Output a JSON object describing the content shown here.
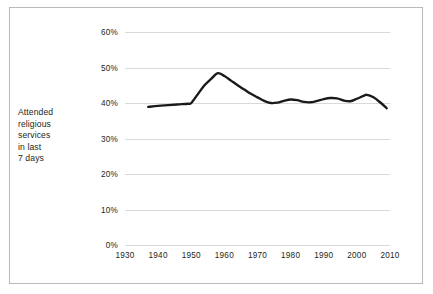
{
  "figure": {
    "y_axis_caption_lines": [
      "Attended",
      "religious",
      "services",
      "in last",
      "7 days"
    ],
    "line_color": "#1a1a1a",
    "grid_color": "#d9d9d9",
    "frame_color": "#b9b9b9",
    "background": "#ffffff"
  },
  "chart_data": {
    "type": "line",
    "title": "",
    "subtitle": "",
    "xlabel": "",
    "ylabel": "Attended religious services in last 7 days",
    "xlim": [
      1930,
      2010
    ],
    "ylim": [
      0,
      60
    ],
    "y_tick_labels": [
      "0%",
      "10%",
      "20%",
      "30%",
      "40%",
      "50%",
      "60%"
    ],
    "y_tick_values": [
      0,
      10,
      20,
      30,
      40,
      50,
      60
    ],
    "x_tick_labels": [
      "1930",
      "1940",
      "1950",
      "1960",
      "1970",
      "1980",
      "1990",
      "2000",
      "2010"
    ],
    "x_tick_values": [
      1930,
      1940,
      1950,
      1960,
      1970,
      1980,
      1990,
      2000,
      2010
    ],
    "grid": "horizontal",
    "legend": "none",
    "series": [
      {
        "name": "Attended religious services in last 7 days",
        "color": "#1a1a1a",
        "x": [
          1937,
          1940,
          1943,
          1946,
          1949,
          1950,
          1952,
          1954,
          1956,
          1958,
          1960,
          1962,
          1964,
          1966,
          1968,
          1970,
          1972,
          1974,
          1976,
          1978,
          1980,
          1982,
          1984,
          1986,
          1988,
          1990,
          1992,
          1994,
          1996,
          1998,
          2000,
          2002,
          2003,
          2005,
          2007,
          2009
        ],
        "values": [
          38.9,
          39.2,
          39.4,
          39.6,
          39.8,
          40.0,
          42.5,
          45.0,
          46.8,
          48.4,
          47.6,
          46.3,
          45.0,
          43.8,
          42.6,
          41.6,
          40.6,
          40.0,
          40.1,
          40.6,
          41.0,
          40.8,
          40.3,
          40.2,
          40.6,
          41.1,
          41.4,
          41.3,
          40.7,
          40.5,
          41.2,
          42.0,
          42.3,
          41.6,
          40.2,
          38.5
        ]
      }
    ]
  }
}
